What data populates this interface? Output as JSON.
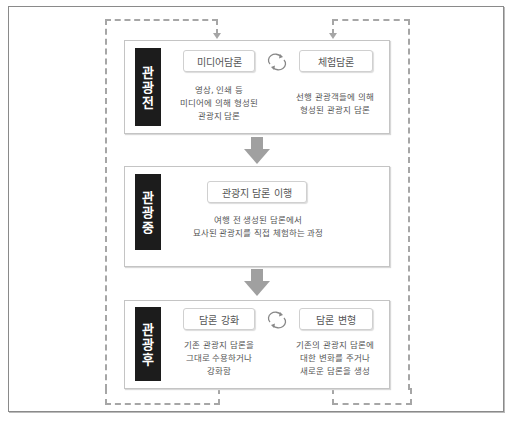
{
  "colors": {
    "label_bar": "#1c1c1c",
    "arrow": "#a0a0a0",
    "dashed_line": "#a6a6a6",
    "box_border": "#c4c4c4"
  },
  "stages": [
    {
      "label": [
        "관",
        "광",
        "전"
      ],
      "items": [
        {
          "title": "미디어담론",
          "description": [
            "영상, 인쇄 등",
            "미디어에 의해 형성된",
            "관광지 담론"
          ]
        },
        {
          "title": "체험담론",
          "description": [
            "선행 관광객들에 의해",
            "형성된 관광지 담론"
          ]
        }
      ],
      "connector_icon": "cycle-icon"
    },
    {
      "label": [
        "관",
        "광",
        "중"
      ],
      "items": [
        {
          "title": "관광지 담론 이행",
          "description": [
            "여행 전 생성된 담론에서",
            "묘사된 관광지를 직접 체험하는 과정"
          ]
        }
      ]
    },
    {
      "label": [
        "관",
        "광",
        "후"
      ],
      "items": [
        {
          "title": "담론 강화",
          "description": [
            "기존 관광지 담론을",
            "그대로 수용하거나",
            "강화함"
          ]
        },
        {
          "title": "담론 변형",
          "description": [
            "기존의 관광지 담론에",
            "대한 변화를 주거나",
            "새로운 담론을 생성"
          ]
        }
      ],
      "connector_icon": "cycle-icon"
    }
  ],
  "flow_arrows": [
    "down-arrow-icon",
    "down-arrow-icon"
  ],
  "feedback_loops": [
    "left-dashed-feedback-loop",
    "right-dashed-feedback-loop"
  ]
}
